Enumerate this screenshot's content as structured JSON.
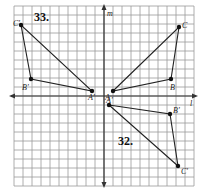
{
  "diagram": {
    "type": "coordinate-grid-reflection",
    "grid": {
      "x_min": -10,
      "x_max": 10,
      "y_min": -10,
      "y_max": 10,
      "cell_px": 9,
      "origin_px": [
        104,
        96
      ]
    },
    "axes": {
      "vertical_label": "m",
      "horizontal_label": "l"
    },
    "problems": [
      {
        "number": "33.",
        "description": "Triangle ABC reflected over line m",
        "original": {
          "A": {
            "label": "A",
            "x": 1,
            "y": 1
          },
          "B": {
            "label": "B",
            "x": 7,
            "y": 2
          },
          "C": {
            "label": "C",
            "x": 8,
            "y": 8
          }
        },
        "image": {
          "A": {
            "label": "A'",
            "x": -1,
            "y": 1
          },
          "B": {
            "label": "B'",
            "x": -7.5,
            "y": 2
          },
          "C": {
            "label": "C'",
            "x": -9,
            "y": 8
          }
        }
      },
      {
        "number": "32.",
        "description": "Triangle ABC reflected over line l",
        "image": {
          "A": {
            "label": "A'",
            "x": 0.5,
            "y": -1
          },
          "B": {
            "label": "B'",
            "x": 7,
            "y": -2
          },
          "C": {
            "label": "C'",
            "x": 8,
            "y": -8
          }
        }
      }
    ],
    "colors": {
      "grid": "#9a9a9a",
      "lines": "#222222",
      "background": "#ffffff"
    }
  }
}
